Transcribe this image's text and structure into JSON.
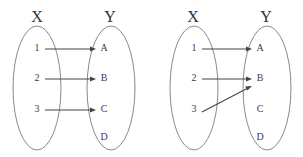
{
  "figure": {
    "background_color": "#ffffff",
    "stroke_color": "#454545",
    "ellipse_color": "#8a8a8a",
    "width": 303,
    "height": 157
  },
  "diagrams": [
    {
      "id": "left-diagram",
      "name": "injective-mapping",
      "domain": {
        "label": "X",
        "label_x": 37,
        "label_y": 18,
        "ellipse": {
          "cx": 37,
          "cy": 88,
          "rx": 24,
          "ry": 62
        },
        "elements": [
          {
            "text": "1",
            "x": 37,
            "y": 49
          },
          {
            "text": "2",
            "x": 37,
            "y": 79
          },
          {
            "text": "3",
            "x": 37,
            "y": 110
          }
        ]
      },
      "codomain": {
        "label": "Y",
        "label_x": 110,
        "label_y": 18,
        "ellipse": {
          "cx": 111,
          "cy": 88,
          "rx": 24,
          "ry": 62
        },
        "elements": [
          {
            "text": "A",
            "x": 104,
            "y": 49
          },
          {
            "text": "B",
            "x": 104,
            "y": 79
          },
          {
            "text": "C",
            "x": 104,
            "y": 110
          },
          {
            "text": "D",
            "x": 104,
            "y": 138
          }
        ]
      },
      "arrows": [
        {
          "from": "1",
          "to": "A",
          "x1": 45,
          "y1": 49,
          "x2": 96,
          "y2": 49
        },
        {
          "from": "2",
          "to": "B",
          "x1": 45,
          "y1": 79,
          "x2": 96,
          "y2": 79
        },
        {
          "from": "3",
          "to": "C",
          "x1": 45,
          "y1": 110,
          "x2": 96,
          "y2": 110
        }
      ]
    },
    {
      "id": "right-diagram",
      "name": "non-injective-mapping",
      "domain": {
        "label": "X",
        "label_x": 193,
        "label_y": 18,
        "ellipse": {
          "cx": 194,
          "cy": 88,
          "rx": 24,
          "ry": 62
        },
        "elements": [
          {
            "text": "1",
            "x": 194,
            "y": 49
          },
          {
            "text": "2",
            "x": 194,
            "y": 79
          },
          {
            "text": "3",
            "x": 194,
            "y": 110
          }
        ]
      },
      "codomain": {
        "label": "Y",
        "label_x": 266,
        "label_y": 18,
        "ellipse": {
          "cx": 267,
          "cy": 88,
          "rx": 24,
          "ry": 62
        },
        "elements": [
          {
            "text": "A",
            "x": 260,
            "y": 49
          },
          {
            "text": "B",
            "x": 260,
            "y": 79
          },
          {
            "text": "C",
            "x": 260,
            "y": 110
          },
          {
            "text": "D",
            "x": 260,
            "y": 138
          }
        ]
      },
      "arrows": [
        {
          "from": "1",
          "to": "A",
          "x1": 202,
          "y1": 49,
          "x2": 252,
          "y2": 49
        },
        {
          "from": "2",
          "to": "B",
          "x1": 202,
          "y1": 79,
          "x2": 252,
          "y2": 79
        },
        {
          "from": "3",
          "to": "B",
          "x1": 202,
          "y1": 112,
          "x2": 252,
          "y2": 86
        }
      ]
    }
  ]
}
